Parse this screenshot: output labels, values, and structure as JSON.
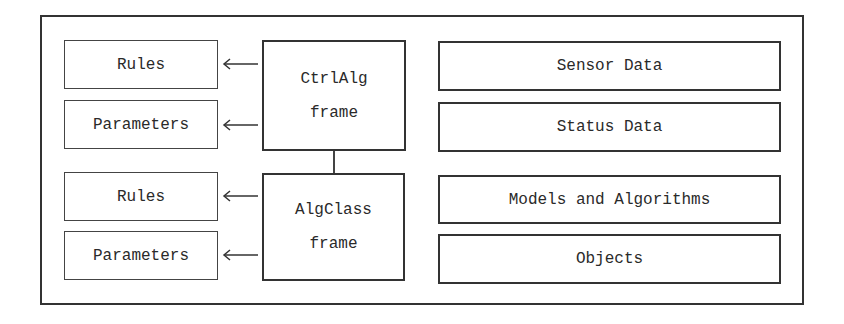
{
  "diagram": {
    "left_top": {
      "rules": "Rules",
      "parameters": "Parameters"
    },
    "left_bottom": {
      "rules": "Rules",
      "parameters": "Parameters"
    },
    "ctrlalg_frame": {
      "line1": "CtrlAlg",
      "line2": "frame"
    },
    "algclass_frame": {
      "line1": "AlgClass",
      "line2": "frame"
    },
    "right": {
      "sensor_data": "Sensor Data",
      "status_data": "Status Data",
      "models_and_algorithms": "Models and Algorithms",
      "objects": "Objects"
    },
    "arrow_icon": "left-arrow",
    "colors": {
      "stroke": "#333333",
      "background": "#ffffff"
    }
  }
}
